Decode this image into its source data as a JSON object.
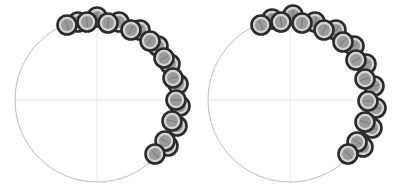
{
  "chart_data": [
    {
      "type": "scatter",
      "subtype": "polar-markers",
      "title": "",
      "grid": true,
      "circle": {
        "cx": 97,
        "cy": 100,
        "r": 82
      },
      "front_markers": [
        [
          67,
          25
        ],
        [
          87,
          22
        ],
        [
          108,
          23
        ],
        [
          131,
          30
        ],
        [
          150,
          41
        ],
        [
          164,
          58
        ],
        [
          173,
          78
        ],
        [
          176,
          100
        ],
        [
          172,
          121
        ],
        [
          165,
          141
        ],
        [
          155,
          154
        ]
      ],
      "back_markers": [
        [
          78,
          22
        ],
        [
          97,
          17
        ],
        [
          119,
          22
        ],
        [
          140,
          30
        ],
        [
          158,
          46
        ],
        [
          170,
          64
        ],
        [
          178,
          84
        ],
        [
          180,
          106
        ],
        [
          177,
          126
        ],
        [
          168,
          146
        ]
      ],
      "colors": {
        "stroke": "#2b2b2b",
        "fill": "#9a9a9a",
        "ring": "#d4d4d4",
        "axis": "#bdbdbd",
        "grid": "#e6e6e6"
      }
    },
    {
      "type": "scatter",
      "subtype": "polar-markers",
      "title": "",
      "grid": true,
      "circle": {
        "cx": 290,
        "cy": 100,
        "r": 82
      },
      "front_markers": [
        [
          261,
          25
        ],
        [
          281,
          22
        ],
        [
          302,
          23
        ],
        [
          324,
          30
        ],
        [
          343,
          42
        ],
        [
          356,
          60
        ],
        [
          365,
          79
        ],
        [
          368,
          101
        ],
        [
          365,
          122
        ],
        [
          357,
          142
        ],
        [
          348,
          154
        ]
      ],
      "back_markers": [
        [
          272,
          19
        ],
        [
          293,
          15
        ],
        [
          315,
          22
        ],
        [
          336,
          30
        ],
        [
          354,
          46
        ],
        [
          366,
          64
        ],
        [
          374,
          86
        ],
        [
          376,
          108
        ],
        [
          372,
          128
        ],
        [
          363,
          147
        ]
      ],
      "colors": {
        "stroke": "#2b2b2b",
        "fill": "#9a9a9a",
        "ring": "#d4d4d4",
        "axis": "#bdbdbd",
        "grid": "#e6e6e6"
      }
    }
  ]
}
